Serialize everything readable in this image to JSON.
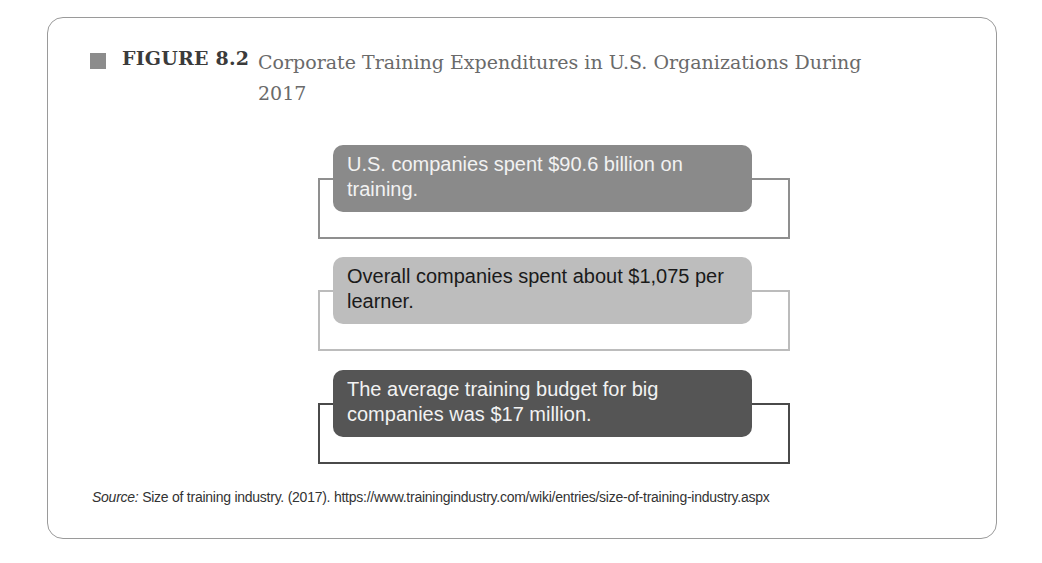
{
  "figure": {
    "label": "FIGURE 8.2",
    "title": "Corporate Training Expenditures in U.S. Organizations During 2017",
    "marker_color": "#8c8c8c"
  },
  "facts": [
    {
      "text": "U.S. companies spent $90.6 billion on training.",
      "fill": "#8a8a8a",
      "text_color": "#f2f2f2",
      "outline": "#8f8f8f"
    },
    {
      "text": "Overall companies spent about $1,075 per learner.",
      "fill": "#bdbdbd",
      "text_color": "#1a1a1a",
      "outline": "#bcbcbc"
    },
    {
      "text": "The average training budget for big companies was $17 million.",
      "fill": "#555555",
      "text_color": "#f2f2f2",
      "outline": "#4a4a4a"
    }
  ],
  "source": {
    "prefix": "Source:",
    "text": " Size of training industry. (2017). https://www.trainingindustry.com/wiki/entries/size-of-training-industry.aspx"
  }
}
